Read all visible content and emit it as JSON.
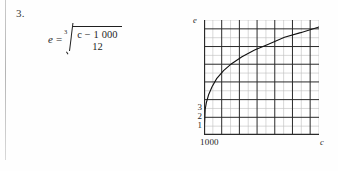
{
  "page": {
    "problem_number": "3."
  },
  "formula": {
    "variable": "e",
    "equals": "=",
    "root_index": "3",
    "numerator": "c − 1 000",
    "numerator_variable": "c",
    "numerator_rest": " − 1 000",
    "denominator": "12",
    "plain_text": "e = cube root of ((c - 1 000) / 12)"
  },
  "graph": {
    "y_axis_label": "e",
    "x_axis_label": "c",
    "x_origin_label": "1000",
    "y_tick_labels": [
      "3",
      "2",
      "1"
    ],
    "grid": {
      "columns": 13,
      "rows": 13,
      "minor_color": "#bdbdbd",
      "major_color": "#2a2a2a",
      "major_every": 2
    },
    "curve": {
      "description": "cube-root curve rising from origin",
      "color": "#111111",
      "points": [
        [
          0.0,
          0.0
        ],
        [
          0.01,
          0.22
        ],
        [
          0.02,
          0.28
        ],
        [
          0.04,
          0.35
        ],
        [
          0.07,
          0.42
        ],
        [
          0.11,
          0.49
        ],
        [
          0.17,
          0.56
        ],
        [
          0.24,
          0.62
        ],
        [
          0.33,
          0.68
        ],
        [
          0.44,
          0.74
        ],
        [
          0.56,
          0.79
        ],
        [
          0.7,
          0.85
        ],
        [
          0.84,
          0.89
        ],
        [
          1.0,
          0.94
        ]
      ]
    }
  },
  "chart_data": {
    "type": "line",
    "title": "",
    "xlabel": "c",
    "ylabel": "e",
    "x_tick_labels": [
      "1000"
    ],
    "y_tick_labels": [
      "1",
      "2",
      "3"
    ],
    "grid": true,
    "legend": "none",
    "series": [
      {
        "name": "e = ((c - 1000)/12)^(1/3)",
        "x": [
          1000,
          1012,
          1108,
          1396,
          1876,
          2548,
          3412,
          4468,
          5716,
          7156,
          8788,
          10612,
          12628,
          14836
        ],
        "y": [
          0,
          1,
          2,
          3,
          4,
          5,
          6,
          7,
          8,
          9,
          10,
          11,
          12,
          13
        ]
      }
    ]
  }
}
